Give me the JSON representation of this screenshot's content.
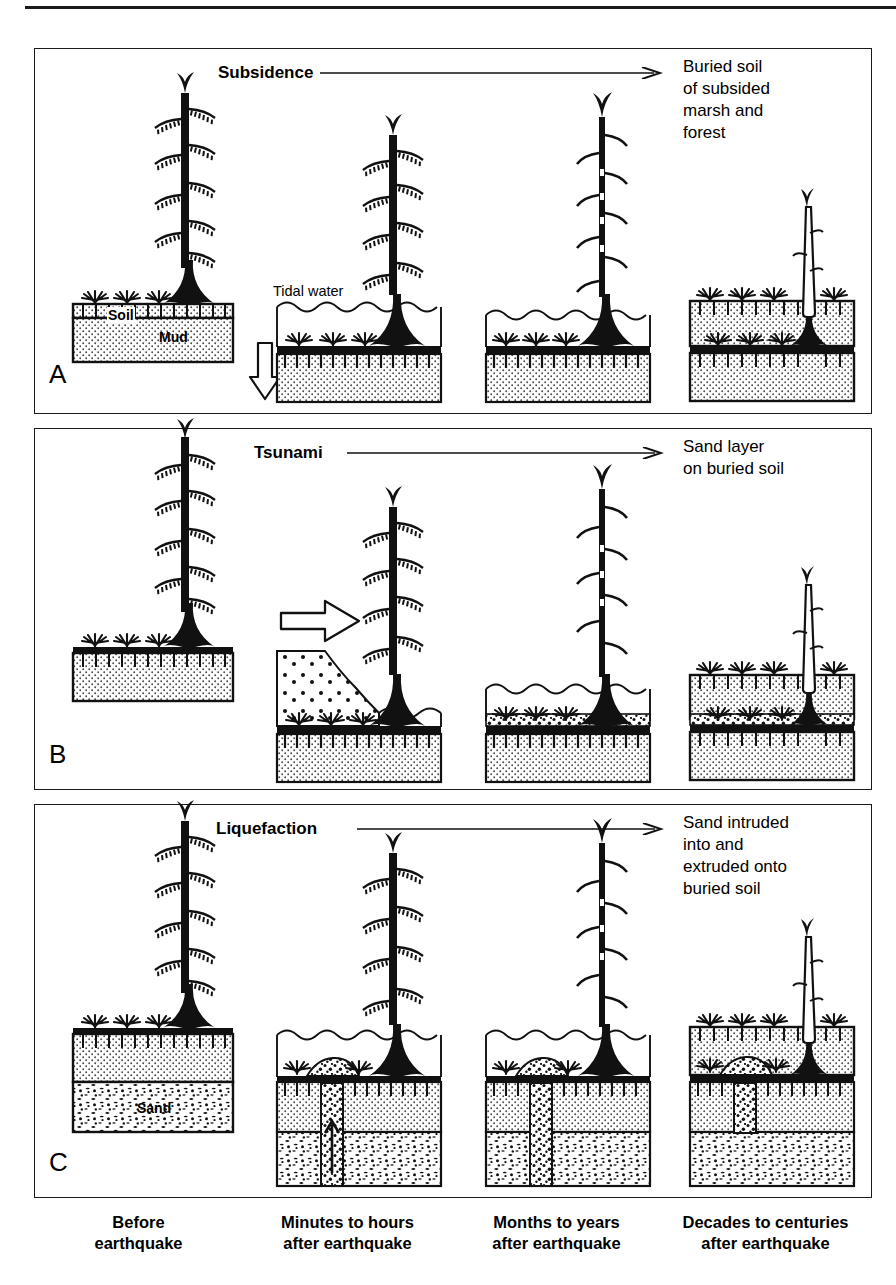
{
  "figure": {
    "title_hidden": "",
    "panels": [
      {
        "id": "A",
        "letter": "A",
        "process": "Subsidence",
        "arrow": "right-arrow",
        "outcome": "Buried soil\nof subsided\nmarsh and\nforest",
        "inline_labels": [
          {
            "text": "Soil",
            "style": "bold"
          },
          {
            "text": "Mud",
            "style": "bold"
          },
          {
            "text": "Tidal water",
            "style": "plain"
          }
        ],
        "stages": [
          {
            "index": 1,
            "time": "Before earthquake",
            "desc": "Upright living spruce on soil over mud; marsh plants at surface"
          },
          {
            "index": 2,
            "time": "Minutes to hours after earthquake",
            "desc": "Land drops; tidal water floods the forest, drowning the tree base"
          },
          {
            "index": 3,
            "time": "Months to years after earthquake",
            "desc": "Tree dead, needles gone; tidal water stands over submerged soil"
          },
          {
            "index": 4,
            "time": "Decades to centuries after earthquake",
            "desc": "Mud buries the former soil; only a snag remains rooted in the buried soil"
          }
        ]
      },
      {
        "id": "B",
        "letter": "B",
        "process": "Tsunami",
        "arrow": "right-arrow",
        "outcome": "Sand layer\non buried soil",
        "inline_labels": [],
        "stages": [
          {
            "index": 1,
            "time": "Before earthquake",
            "desc": "Upright living spruce on marsh soil"
          },
          {
            "index": 2,
            "time": "Minutes to hours after earthquake",
            "desc": "Tsunami surge carries sand landward over the subsided marsh"
          },
          {
            "index": 3,
            "time": "Months to years after earthquake",
            "desc": "Sand sheet rests on the buried soil beneath tidal water"
          },
          {
            "index": 4,
            "time": "Decades to centuries after earthquake",
            "desc": "Mud buries sand layer and soil; snag remains"
          }
        ]
      },
      {
        "id": "C",
        "letter": "C",
        "process": "Liquefaction",
        "arrow": "right-arrow",
        "outcome": "Sand intruded\ninto and\nextruded onto\nburied soil",
        "inline_labels": [
          {
            "text": "Sand",
            "style": "bold"
          }
        ],
        "stages": [
          {
            "index": 1,
            "time": "Before earthquake",
            "desc": "Soil over mud over a sand bed; living spruce"
          },
          {
            "index": 2,
            "time": "Minutes to hours after earthquake",
            "desc": "Shaking liquefies sand; a dike injects upward and a vent erupts sand onto the marsh surface"
          },
          {
            "index": 3,
            "time": "Months to years after earthquake",
            "desc": "Sand dike and surface sand blow preserved under tidal water"
          },
          {
            "index": 4,
            "time": "Decades to centuries after earthquake",
            "desc": "Mud buries the vented sand and soil; snag remains"
          }
        ]
      }
    ],
    "timeline_columns": [
      "Before\nearthquake",
      "Minutes to hours\nafter earthquake",
      "Months  to years\nafter earthquake",
      "Decades to centuries\nafter earthquake"
    ],
    "colors": {
      "ink": "#111111",
      "background": "#ffffff",
      "stipple_fill": "#d9d9d9",
      "sand_fill": "#ffffff"
    }
  }
}
